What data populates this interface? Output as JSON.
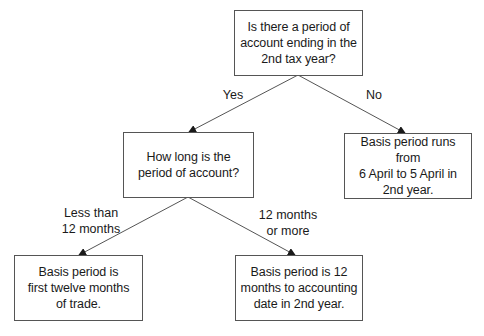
{
  "diagram": {
    "type": "decision-tree",
    "colors": {
      "line": "#555555",
      "box_border": "#555555",
      "text": "#1a1a1a",
      "background": "#ffffff"
    },
    "nodes": [
      {
        "id": "q1",
        "kind": "question",
        "text": "Is there a period of\naccount ending in the\n2nd tax year?"
      },
      {
        "id": "q2",
        "kind": "question",
        "text": "How long is the\nperiod of account?"
      },
      {
        "id": "r1",
        "kind": "result",
        "text": "Basis period runs from\n6 April to 5 April in\n2nd year."
      },
      {
        "id": "r2",
        "kind": "result",
        "text": "Basis period is\nfirst twelve months\nof trade."
      },
      {
        "id": "r3",
        "kind": "result",
        "text": "Basis period is 12\nmonths to accounting\ndate in 2nd year."
      }
    ],
    "edges": [
      {
        "from": "q1",
        "to": "q2",
        "label": "Yes"
      },
      {
        "from": "q1",
        "to": "r1",
        "label": "No"
      },
      {
        "from": "q2",
        "to": "r2",
        "label": "Less than\n12 months"
      },
      {
        "from": "q2",
        "to": "r3",
        "label": "12 months\nor more"
      }
    ]
  }
}
